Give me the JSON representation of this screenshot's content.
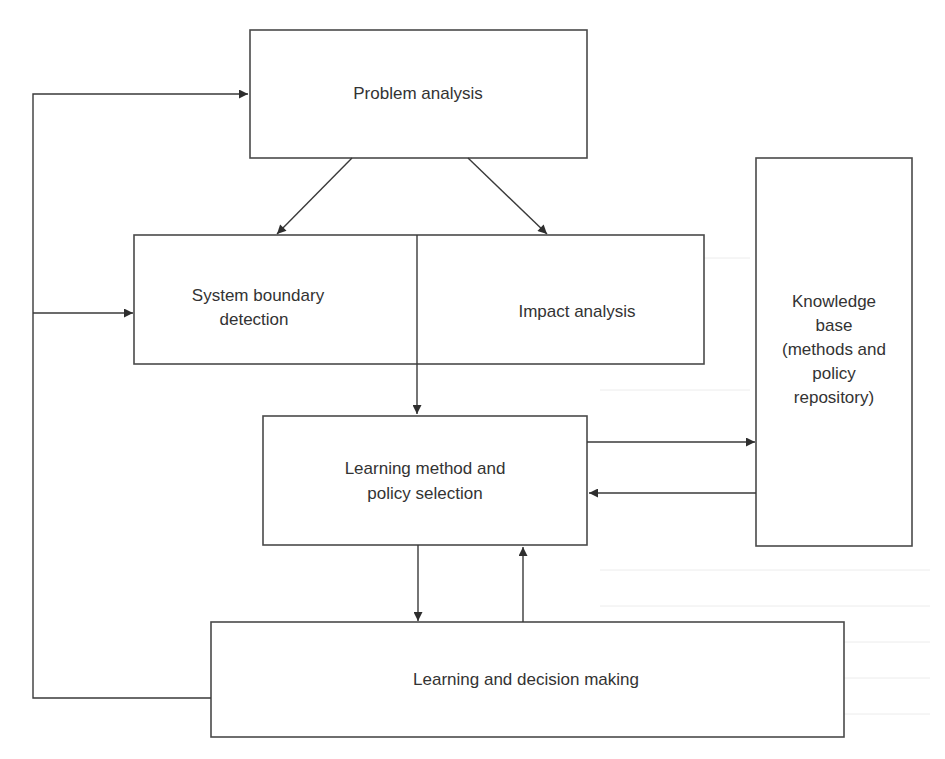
{
  "diagram": {
    "nodes": {
      "problem_analysis": {
        "label": "Problem analysis"
      },
      "system_boundary": {
        "line1": "System boundary",
        "line2": "detection"
      },
      "impact_analysis": {
        "label": "Impact analysis"
      },
      "knowledge_base": {
        "line1": "Knowledge",
        "line2": "base",
        "line3": "(methods and",
        "line4": "policy",
        "line5": "repository)"
      },
      "learning_method": {
        "line1": "Learning method and",
        "line2": "policy selection"
      },
      "learning_decision": {
        "label": "Learning and decision making"
      }
    },
    "edges": [
      {
        "from": "Problem analysis",
        "to": "System boundary detection"
      },
      {
        "from": "Problem analysis",
        "to": "Impact analysis"
      },
      {
        "from": "System boundary detection / Impact analysis",
        "to": "Learning method and policy selection"
      },
      {
        "from": "Learning method and policy selection",
        "to": "Knowledge base"
      },
      {
        "from": "Knowledge base",
        "to": "Learning method and policy selection"
      },
      {
        "from": "Learning method and policy selection",
        "to": "Learning and decision making"
      },
      {
        "from": "Learning and decision making",
        "to": "Learning method and policy selection"
      },
      {
        "from": "Learning and decision making",
        "to": "Problem analysis"
      },
      {
        "from": "Learning and decision making",
        "to": "System boundary detection"
      }
    ],
    "colors": {
      "stroke": "#4a4a4a",
      "text": "#333333",
      "background": "#ffffff"
    }
  }
}
